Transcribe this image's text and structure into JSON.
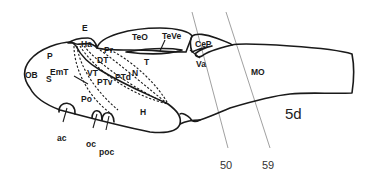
{
  "diagram": {
    "stage_label": "5d",
    "section_lines": [
      {
        "label": "50"
      },
      {
        "label": "59"
      }
    ],
    "regions": {
      "E": "E",
      "Ha": "Ha",
      "P": "P",
      "OB": "OB",
      "S": "S",
      "EmT": "EmT",
      "VT": "VT",
      "DT": "DT",
      "Pr": "Pr",
      "PTv": "PTv",
      "PTd": "PTd",
      "N": "N",
      "Po": "Po",
      "H": "H",
      "TeO": "TeO",
      "TeVe": "TeVe",
      "T": "T",
      "CeP": "CeP",
      "Va": "Va",
      "MO": "MO",
      "ac": "ac",
      "oc": "oc",
      "poc": "poc"
    }
  }
}
